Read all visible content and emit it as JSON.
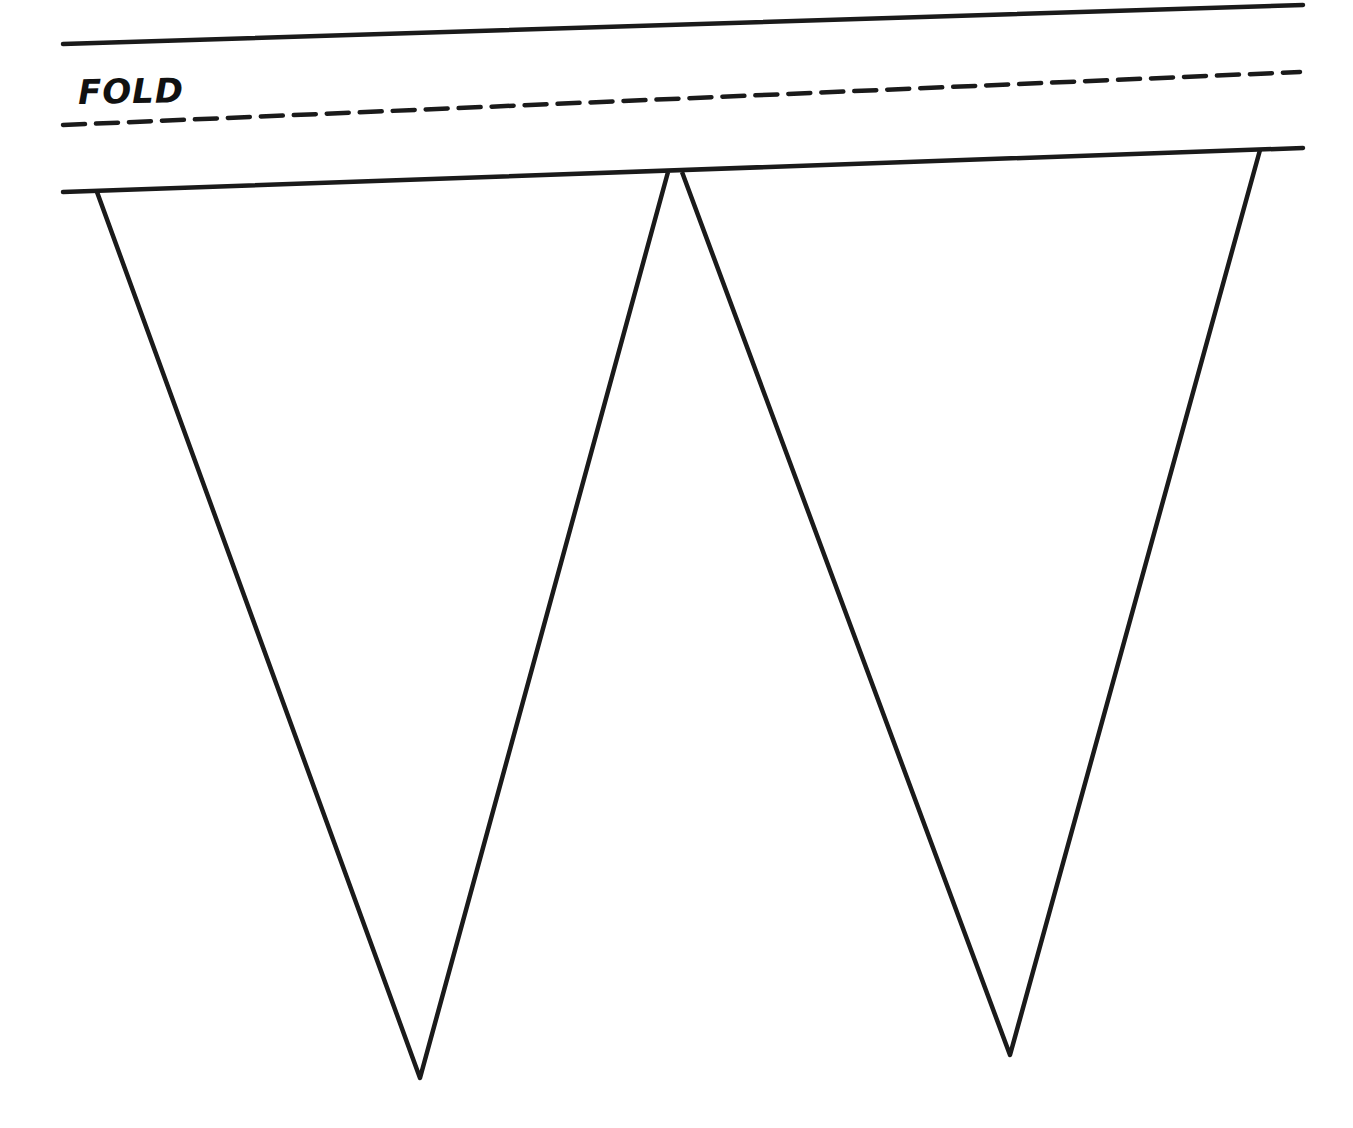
{
  "template": {
    "title": "Bunting pennant template",
    "fold_label": "FOLD",
    "line_color": "#1a1a1a",
    "background": "#ffffff",
    "strip": {
      "top_line": {
        "x1": 63,
        "y1": 44,
        "x2": 1303,
        "y2": 5
      },
      "fold_line": {
        "x1": 63,
        "y1": 125,
        "x2": 1300,
        "y2": 72
      },
      "bottom_line": {
        "x1": 63,
        "y1": 192,
        "x2": 1303,
        "y2": 148
      }
    },
    "pennants": [
      {
        "name": "pennant-left",
        "points": "97,192 668,172 420,1078"
      },
      {
        "name": "pennant-right",
        "points": "682,172 1260,150 1010,1055"
      }
    ]
  }
}
